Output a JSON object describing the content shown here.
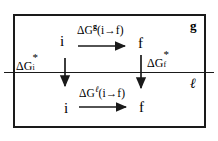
{
  "figure": {
    "phase_labels": {
      "gas": "g",
      "liquid": "ℓ"
    },
    "states": {
      "initial": "i",
      "final": "f"
    },
    "transitions": {
      "gas": {
        "label_delta_g": "ΔG",
        "label_superscript": "g",
        "label_argument": "(i→f)",
        "arrow": "right-arrow"
      },
      "liquid": {
        "label_delta_g": "ΔG",
        "label_superscript": "ℓ",
        "label_argument": "(i→f)",
        "arrow": "right-arrow"
      }
    },
    "solvation": {
      "initial": {
        "label_delta_g": "ΔG",
        "superscript": "*",
        "subscript": "i",
        "arrow": "down-arrow"
      },
      "final": {
        "label_delta_g": "ΔG",
        "superscript": "*",
        "subscript": "f",
        "arrow": "down-arrow"
      }
    },
    "colors": {
      "ink": "#1a1a1a",
      "background": "#ffffff"
    }
  }
}
